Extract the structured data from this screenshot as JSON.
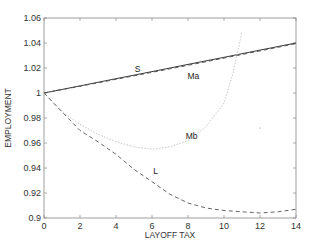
{
  "chart_data": {
    "type": "line",
    "title": "",
    "xlabel": "LAYOFF TAX",
    "ylabel": "EMPLOYMENT",
    "xlim": [
      0,
      14
    ],
    "ylim": [
      0.9,
      1.06
    ],
    "xticks": [
      0,
      2,
      4,
      6,
      8,
      10,
      12,
      14
    ],
    "yticks": [
      0.9,
      0.92,
      0.94,
      0.96,
      0.98,
      1,
      1.02,
      1.04,
      1.06
    ],
    "xtick_labels": [
      "0",
      "2",
      "4",
      "6",
      "8",
      "10",
      "12",
      "14"
    ],
    "ytick_labels": [
      "0.9",
      "0.92",
      "0.94",
      "0.96",
      "0.98",
      "1",
      "1.02",
      "1.04",
      "1.06"
    ],
    "grid": false,
    "legend": "none (inline curve labels)",
    "series": [
      {
        "name": "S",
        "style": "solid",
        "color": "#222222",
        "x": [
          0,
          2,
          4,
          6,
          8,
          10,
          12,
          14
        ],
        "y": [
          1.0,
          1.0057,
          1.0114,
          1.0171,
          1.0229,
          1.0286,
          1.0343,
          1.04
        ]
      },
      {
        "name": "Ma",
        "style": "dashed",
        "color": "#555555",
        "x": [
          0,
          2,
          4,
          6,
          8,
          10,
          12,
          14
        ],
        "y": [
          1.0,
          1.0054,
          1.011,
          1.0166,
          1.0222,
          1.0279,
          1.0337,
          1.0395
        ]
      },
      {
        "name": "Mb",
        "style": "dotted",
        "color": "#c8c8c8",
        "x": [
          0,
          1,
          2,
          3,
          4,
          5,
          6,
          7,
          8,
          9,
          10,
          10.5,
          11
        ],
        "y": [
          1.0,
          0.985,
          0.975,
          0.967,
          0.961,
          0.957,
          0.955,
          0.957,
          0.962,
          0.973,
          0.992,
          1.016,
          1.049
        ]
      },
      {
        "name": "L",
        "style": "dashed",
        "color": "#666666",
        "x": [
          0,
          1,
          2,
          3,
          4,
          5,
          6,
          7,
          8,
          9,
          10,
          11,
          12,
          13,
          14
        ],
        "y": [
          1.0,
          0.985,
          0.97,
          0.961,
          0.951,
          0.939,
          0.929,
          0.919,
          0.912,
          0.908,
          0.906,
          0.905,
          0.904,
          0.905,
          0.907
        ]
      }
    ],
    "annotations": [
      {
        "text": "S",
        "x": 5.2,
        "y": 1.017
      },
      {
        "text": "Ma",
        "x": 8.3,
        "y": 1.011
      },
      {
        "text": "Mb",
        "x": 8.2,
        "y": 0.963
      },
      {
        "text": "L",
        "x": 6.2,
        "y": 0.935
      }
    ]
  }
}
